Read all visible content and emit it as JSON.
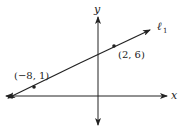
{
  "diagram": {
    "axis_x_label": "x",
    "axis_y_label": "y",
    "line_label": "ℓ",
    "line_label_sub": "1",
    "points": [
      {
        "label": "(−8, 1)",
        "x": -8,
        "y": 1
      },
      {
        "label": "(2, 6)",
        "x": 2,
        "y": 6
      }
    ],
    "colors": {
      "stroke": "#222222",
      "background": "#ffffff"
    }
  }
}
